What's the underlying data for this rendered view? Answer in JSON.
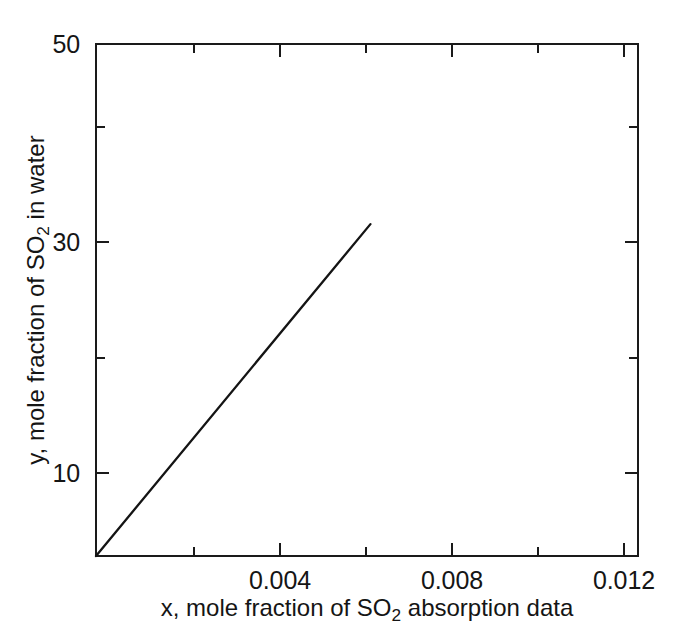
{
  "chart_data": {
    "type": "line",
    "title": "",
    "xlabel": "x, mole fraction of SO2 absorption data",
    "ylabel": "y, mole fraction of SO2 in water",
    "xlabel_parts": {
      "pre": "x, mole fraction of SO",
      "sub": "2",
      "post": " absorption data"
    },
    "ylabel_parts": {
      "pre": "y, mole fraction of SO",
      "sub": "2",
      "post": " in water"
    },
    "xlim": [
      0.00172,
      0.01432
    ],
    "ylim": [
      4.8,
      50
    ],
    "grid": false,
    "legend": null,
    "x_major_ticks": [
      0.004,
      0.008,
      0.012
    ],
    "x_major_tick_labels": [
      "0.004",
      "0.008",
      "0.012"
    ],
    "x_minor_ticks": [
      0.002,
      0.006,
      0.01,
      0.014
    ],
    "y_major_ticks": [
      10,
      30,
      50
    ],
    "y_major_tick_labels": [
      "10",
      "30",
      "50"
    ],
    "y_minor_ticks": [
      20,
      40
    ],
    "tick_direction": "in",
    "box_frame": true,
    "series": [
      {
        "name": "equilibrium line",
        "x": [
          0.00172,
          0.0081
        ],
        "y": [
          4.8,
          34.1
        ],
        "style": "solid",
        "color": "#141414"
      }
    ]
  },
  "axes": {
    "x_tick_labels": [
      "0.004",
      "0.008",
      "0.012"
    ],
    "y_tick_labels": [
      "50",
      "30",
      "10"
    ]
  }
}
